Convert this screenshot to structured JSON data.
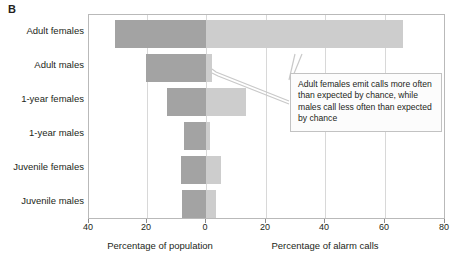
{
  "panel": {
    "letter": "B"
  },
  "chart_data": {
    "type": "bar",
    "orientation": "horizontal",
    "style": "back-to-back diverging bar chart",
    "title": "",
    "categories": [
      "Adult females",
      "Adult males",
      "1-year females",
      "1-year males",
      "Juvenile females",
      "Juvenile males"
    ],
    "series": [
      {
        "name": "Percentage of population",
        "direction": "left",
        "color": "#a3a3a3",
        "values": [
          30.5,
          20.0,
          13.0,
          7.5,
          8.5,
          8.0
        ]
      },
      {
        "name": "Percentage of alarm calls",
        "direction": "right",
        "color": "#cdcdcd",
        "values": [
          66.0,
          2.0,
          13.5,
          1.5,
          5.0,
          3.5
        ]
      }
    ],
    "xlabel_left": "Percentage of population",
    "xlabel_right": "Percentage of alarm calls",
    "ylabel": "",
    "ticks": [
      {
        "label": "40",
        "value": -40
      },
      {
        "label": "20",
        "value": -20
      },
      {
        "label": "0",
        "value": 0
      },
      {
        "label": "20",
        "value": 20
      },
      {
        "label": "40",
        "value": 40
      },
      {
        "label": "60",
        "value": 60
      },
      {
        "label": "80",
        "value": 80
      }
    ],
    "xlim": [
      -40,
      80
    ],
    "grid": true,
    "legend": "none",
    "annotations": [
      {
        "text": "Adult females emit calls more often than expected by chance, while males call less often than expected by chance",
        "points_to": [
          "Adult females alarm-call bar",
          "Adult males alarm-call bar"
        ]
      }
    ]
  }
}
